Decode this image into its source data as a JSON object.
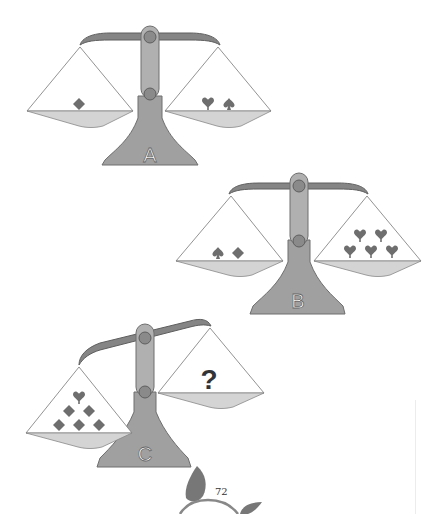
{
  "page": {
    "page_number": "72",
    "colors": {
      "metal": "#8c8c8c",
      "metal_dark": "#6e6e6e",
      "post": "#a9a9a9",
      "pan": "#d2d2d2",
      "suit": "#6b6b6b",
      "string": "#666666",
      "label_fill": "#ffffff"
    }
  },
  "scales": [
    {
      "id": "A",
      "label": "A",
      "tilt": "level",
      "left_pan": {
        "items": [
          "diamond"
        ]
      },
      "right_pan": {
        "items": [
          "heart",
          "spade"
        ]
      }
    },
    {
      "id": "B",
      "label": "B",
      "tilt": "level",
      "left_pan": {
        "items": [
          "spade",
          "diamond"
        ]
      },
      "right_pan": {
        "items": [
          "heart",
          "heart",
          "heart",
          "heart",
          "heart"
        ]
      }
    },
    {
      "id": "C",
      "label": "C",
      "tilt": "left-down",
      "left_pan": {
        "items": [
          "heart",
          "diamond",
          "diamond",
          "diamond",
          "diamond",
          "diamond"
        ]
      },
      "right_pan": {
        "items": [],
        "unknown": "?"
      }
    }
  ]
}
